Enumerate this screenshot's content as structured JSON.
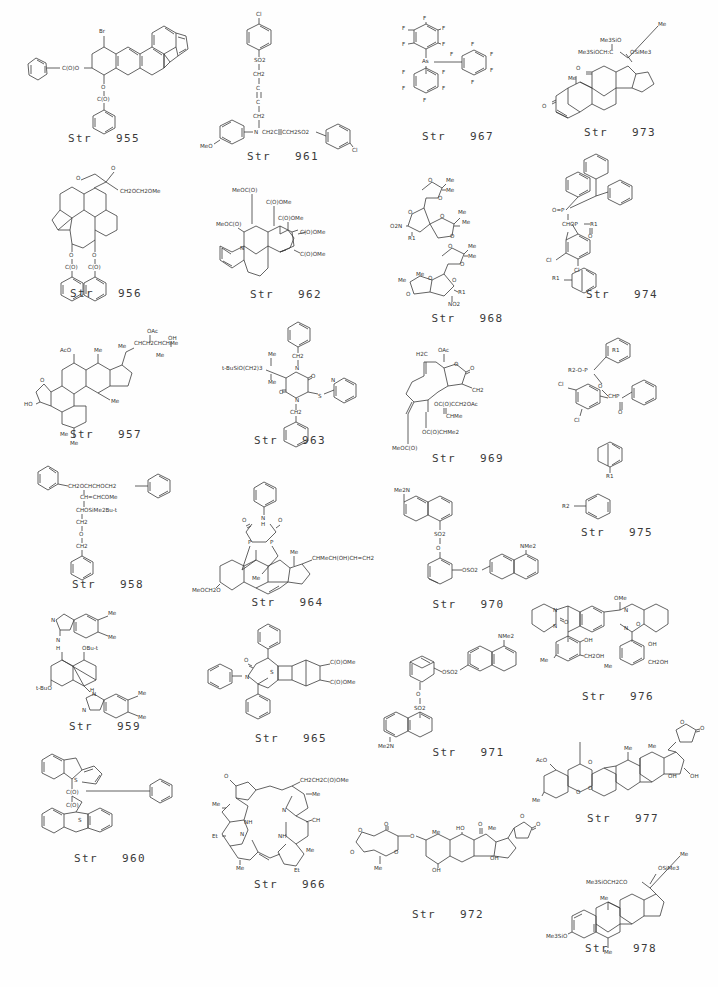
{
  "page": {
    "background_color": "#ffffff",
    "ink_color": "#3b3b3b",
    "columns": 4,
    "rows": 6,
    "caption_prefix": "Str"
  },
  "structures": [
    {
      "id": "955",
      "caption": "Str   955",
      "column": 1,
      "row": 1,
      "labels": [
        "Br",
        "C(O)O",
        "O",
        "C(O)"
      ],
      "description": "Brominated tetrahydro-benzofluoranthene bis-benzoate"
    },
    {
      "id": "956",
      "caption": "Str   956",
      "column": 1,
      "row": 2,
      "labels": [
        "O",
        "O",
        "CH2OCH2OMe",
        "O",
        "O",
        "C(O)",
        "C(O)"
      ],
      "description": "Polycyclic diterpene lactone dibenzoate"
    },
    {
      "id": "957",
      "caption": "Str   957",
      "column": 1,
      "row": 3,
      "labels": [
        "OAc",
        "Me",
        "OH",
        "CHCH2CHCHMe",
        "Me",
        "AcO",
        "O",
        "HO",
        "Me",
        "Me",
        "Me",
        "Me"
      ],
      "description": "Acetoxy triterpenoid polyol side chain"
    },
    {
      "id": "958",
      "caption": "Str   958",
      "column": 1,
      "row": 4,
      "labels": [
        "CH2OCHCHOCH2",
        "CH=CHCOMe",
        "CHOSiMe2Bu-t",
        "CH2",
        "O",
        "CH2"
      ],
      "description": "Benzyl-protected polyether chain with silyl ether"
    },
    {
      "id": "959",
      "caption": "Str   959",
      "column": 1,
      "row": 5,
      "labels": [
        "N",
        "Me",
        "Me",
        "N",
        "H",
        "OBu-t",
        "H",
        "t-BuO",
        "N",
        "H",
        "N",
        "Me",
        "Me"
      ],
      "description": "Bis-benzimidazole bridged bicyclic bis-tert-butyl ether"
    },
    {
      "id": "960",
      "caption": "Str   960",
      "column": 1,
      "row": 6,
      "labels": [
        "S",
        "C(O)",
        "C(O)",
        "S"
      ],
      "description": "Bis-benzothiophene indene diketone with phenyl"
    },
    {
      "id": "961",
      "caption": "Str   961",
      "column": 2,
      "row": 1,
      "labels": [
        "Cl",
        "SO2",
        "CH2",
        "C",
        "C",
        "CH2",
        "N",
        "CH2C",
        "CCH2SO2",
        "MeO",
        "Cl"
      ],
      "description": "Bis(4-chlorophenylsulfonyl) butynyl aniline"
    },
    {
      "id": "962",
      "caption": "Str   962",
      "column": 2,
      "row": 2,
      "labels": [
        "MeOC(O)",
        "C(O)OMe",
        "MeOC(O)",
        "C(O)OMe",
        "C(O)OMe",
        "C(O)OMe",
        "N"
      ],
      "description": "Tetrahydroquinoline fused cyclopentane tetraester"
    },
    {
      "id": "963",
      "caption": "Str   963",
      "column": 2,
      "row": 3,
      "labels": [
        "CH2",
        "Me",
        "t-BuSiO(CH2)3",
        "Me",
        "N",
        "O",
        "O",
        "N",
        "S",
        "N",
        "CH2"
      ],
      "description": "Dibenzyl diketopiperazine with pyridylthio and silyl ether"
    },
    {
      "id": "964",
      "caption": "Str   964",
      "column": 2,
      "row": 4,
      "labels": [
        "O",
        "N",
        "H",
        "O",
        "Me",
        "CHMeCH(OH)CH=CH2",
        "P",
        "P",
        "Me",
        "MeOCH2O"
      ],
      "description": "Steroid bis-phosphine hydantoin complex"
    },
    {
      "id": "965",
      "caption": "Str   965",
      "column": 2,
      "row": 5,
      "labels": [
        "O",
        "N",
        "S",
        "C(O)OMe",
        "C(O)OMe"
      ],
      "description": "Triphenyl thiazolidinone cyclobutane bicyclic diester"
    },
    {
      "id": "966",
      "caption": "Str   966",
      "column": 2,
      "row": 6,
      "labels": [
        "O",
        "CH2CH2C(O)OMe",
        "Me",
        "Me",
        "NH",
        "N",
        "CH",
        "N",
        "NH",
        "Et",
        "Me",
        "Me",
        "Et"
      ],
      "description": "Purpurin / chlorin macrocycle with propionate ester"
    },
    {
      "id": "967",
      "caption": "Str   967",
      "column": 3,
      "row": 1,
      "labels": [
        "F",
        "F",
        "F",
        "F",
        "F",
        "As",
        "F",
        "F",
        "F",
        "F",
        "F",
        "F",
        "F",
        "F",
        "F",
        "F",
        "F",
        "F",
        "F",
        "F"
      ],
      "description": "Tris(pentafluorophenyl)arsine with pentafluorophenyl"
    },
    {
      "id": "968",
      "caption": "Str   968",
      "column": 3,
      "row": 2,
      "labels": [
        "O",
        "Me",
        "Me",
        "O",
        "O",
        "Me",
        "Me",
        "O2N",
        "O",
        "R1",
        "O",
        "Me",
        "Me",
        "O",
        "Me",
        "Me",
        "O",
        "O",
        "O",
        "R1",
        "NO2"
      ],
      "description": "Two diacetonide furanose nitro sugars"
    },
    {
      "id": "969",
      "caption": "Str   969",
      "column": 3,
      "row": 3,
      "labels": [
        "H2C",
        "OAc",
        "O",
        "O",
        "CH2",
        "OC(O)CCH2OAc",
        "CHMe",
        "OC(O)CHMe2",
        "MeOC(O)"
      ],
      "description": "Germacranolide sesquiterpene lactone polyester"
    },
    {
      "id": "970",
      "caption": "Str   970",
      "column": 3,
      "row": 4,
      "labels": [
        "Me2N",
        "SO2",
        "O",
        "OSO2",
        "NMe2"
      ],
      "description": "Catechol bis(dansyl) sulfonate ester"
    },
    {
      "id": "971",
      "caption": "Str   971",
      "column": 3,
      "row": 5,
      "labels": [
        "NMe2",
        "OSO2",
        "O",
        "SO2",
        "Me2N"
      ],
      "description": "Resorcinol bis(dansyl) sulfonate ester"
    },
    {
      "id": "972",
      "caption": "Str   972",
      "column": 3,
      "row": 6,
      "labels": [
        "O",
        "O",
        "O",
        "O",
        "O",
        "Me",
        "O",
        "HO",
        "O",
        "Me",
        "Me",
        "OH",
        "OH",
        "O",
        "O"
      ],
      "description": "Cardenolide glycoside with methylenedioxy sugar"
    },
    {
      "id": "973",
      "caption": "Str   973",
      "column": 4,
      "row": 1,
      "labels": [
        "Me3SiO",
        "Me",
        "Me3SiOCH:C",
        "OSiMe3",
        "O",
        "Me",
        "O"
      ],
      "description": "Silylated 11-keto steroid enol ether"
    },
    {
      "id": "974",
      "caption": "Str   974",
      "column": 4,
      "row": 2,
      "labels": [
        "O=P",
        "CHOP",
        "R1",
        "O",
        "Cl",
        "Cl",
        "R1"
      ],
      "description": "Dichlorophenyl phosphonate diester with triaryl phosphine"
    },
    {
      "id": "975",
      "caption": "Str   975",
      "column": 4,
      "row": 3,
      "labels": [
        "R1",
        "R2",
        "H2C",
        "O",
        "P",
        "O",
        "CHP",
        "O",
        "Cl",
        "Cl"
      ],
      "description": "Substituted phenyl pair R1 / R2"
    },
    {
      "id": "976",
      "caption": "Str   976",
      "column": 4,
      "row": 4,
      "labels": [
        "OMe",
        "N",
        "O",
        "N",
        "O",
        "N",
        "N",
        "OH",
        "OH",
        "Me",
        "CH2OH",
        "Me",
        "CH2OH"
      ],
      "description": "Bis(tetrahydropyrimidinone) bridged bisphenol"
    },
    {
      "id": "977",
      "caption": "Str   977",
      "column": 4,
      "row": 5,
      "labels": [
        "O",
        "O",
        "Me",
        "AcO",
        "O",
        "O",
        "Me",
        "O",
        "Me",
        "OH",
        "OH"
      ],
      "description": "Dioxane-linked acetoxy steroid butenolide"
    },
    {
      "id": "978",
      "caption": "Str   978",
      "column": 4,
      "row": 6,
      "labels": [
        "Me",
        "OSiMe3",
        "Me3SiOCH2CO",
        "Me",
        "Me3SiO",
        "Me"
      ],
      "description": "Bis-trimethylsilyl steroid dienol ether"
    }
  ]
}
